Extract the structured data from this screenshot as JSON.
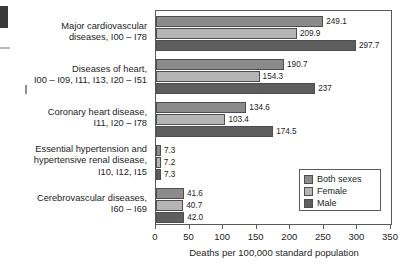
{
  "chart_data": {
    "type": "bar",
    "orientation": "horizontal",
    "title": "",
    "xlabel": "Deaths per 100,000 standard population",
    "ylabel": "",
    "xlim": [
      0,
      350
    ],
    "xticks": [
      0,
      50,
      100,
      150,
      200,
      250,
      300,
      350
    ],
    "grid": false,
    "legend_position": "lower-right",
    "categories": [
      "Major cardiovascular\ndiseases, I00 – I78",
      "Diseases of heart,\nI00 – I09, I11, I13, I20 – I51",
      "Coronary heart disease,\nI11, I20 – I78",
      "Essential hypertension and\nhypertensive renal disease,\nI10, I12, I15",
      "Cerebrovascular diseases,\nI60 – I69"
    ],
    "series": [
      {
        "name": "Both sexes",
        "color": "#8b8b8b",
        "values": [
          249.1,
          190.7,
          134.6,
          7.3,
          41.6
        ],
        "labels": [
          "249.1",
          "190.7",
          "134.6",
          "7.3",
          "41.6"
        ]
      },
      {
        "name": "Female",
        "color": "#b5b5b5",
        "values": [
          209.9,
          154.3,
          103.4,
          7.2,
          40.7
        ],
        "labels": [
          "209.9",
          "154.3",
          "103.4",
          "7.2",
          "40.7"
        ]
      },
      {
        "name": "Male",
        "color": "#5e5e5e",
        "values": [
          297.7,
          237,
          174.5,
          7.3,
          42.0
        ],
        "labels": [
          "297.7",
          "237",
          "174.5",
          "7.3",
          "42.0"
        ]
      }
    ]
  },
  "legend": {
    "items": [
      {
        "label": "Both sexes",
        "swatch": "both"
      },
      {
        "label": "Female",
        "swatch": "female"
      },
      {
        "label": "Male",
        "swatch": "male"
      }
    ]
  },
  "axis": {
    "tick_labels": [
      "0",
      "50",
      "100",
      "150",
      "200",
      "250",
      "300",
      "350"
    ],
    "title": "Deaths per 100,000 standard population"
  },
  "colors": {
    "both_sexes": "#8b8b8b",
    "female": "#b5b5b5",
    "male": "#5e5e5e",
    "outline": "#4e4e4e",
    "frame": "#5a5a5a",
    "text": "#1d1d1d"
  }
}
